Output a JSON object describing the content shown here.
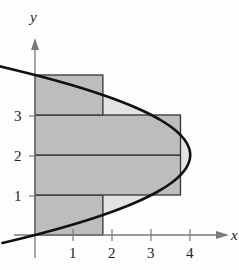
{
  "chart_data": {
    "type": "diagram",
    "curve": {
      "equation": "x = 4y - y^2",
      "vertex": [
        4,
        2
      ],
      "y_range": [
        -0.2,
        4.3
      ]
    },
    "rectangles": [
      {
        "y_from": 0,
        "y_to": 1,
        "width": 1.75
      },
      {
        "y_from": 1,
        "y_to": 2,
        "width": 3.75
      },
      {
        "y_from": 2,
        "y_to": 3,
        "width": 3.75
      },
      {
        "y_from": 3,
        "y_to": 4,
        "width": 1.75
      }
    ],
    "xlabel": "x",
    "ylabel": "y",
    "x_ticks": [
      "1",
      "2",
      "3",
      "4"
    ],
    "y_ticks": [
      "1",
      "2",
      "3"
    ],
    "colors": {
      "rect_fill": "#bdbdbd",
      "region_fill": "#e2e2e2",
      "curve": "#111111",
      "axis": "#777777"
    }
  },
  "labels": {
    "x_axis": "x",
    "y_axis": "y",
    "x_tick_1": "1",
    "x_tick_2": "2",
    "x_tick_3": "3",
    "x_tick_4": "4",
    "y_tick_1": "1",
    "y_tick_2": "2",
    "y_tick_3": "3"
  }
}
